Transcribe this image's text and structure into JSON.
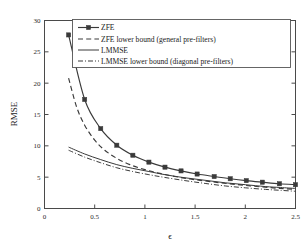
{
  "chart_data": {
    "type": "line",
    "title": "",
    "xlabel": "ϵ",
    "ylabel": "RMSE",
    "xlim": [
      0,
      2.5
    ],
    "ylim": [
      0,
      30
    ],
    "xticks": [
      0,
      0.5,
      1,
      1.5,
      2,
      2.5
    ],
    "xticklabels": [
      "0",
      "0.5",
      "1",
      "1.5",
      "2",
      "2.5"
    ],
    "yticks": [
      0,
      5,
      10,
      15,
      20,
      25,
      30
    ],
    "yticklabels": [
      "0",
      "5",
      "10",
      "15",
      "20",
      "25",
      "30"
    ],
    "grid": false,
    "legend_position": "upper right",
    "series": [
      {
        "name": "ZFE",
        "style": "solid-with-markers",
        "marker": "filled-square",
        "x": [
          0.24,
          0.4,
          0.56,
          0.72,
          0.88,
          1.04,
          1.2,
          1.36,
          1.52,
          1.69,
          1.85,
          2.01,
          2.17,
          2.34,
          2.5
        ],
        "y": [
          27.7,
          17.4,
          12.75,
          10.1,
          8.5,
          7.4,
          6.6,
          6.0,
          5.5,
          5.1,
          4.75,
          4.45,
          4.2,
          3.95,
          3.8
        ]
      },
      {
        "name": "ZFE lower bound (general pre-filters)",
        "style": "dashed",
        "x": [
          0.24,
          0.32,
          0.4,
          0.5,
          0.6,
          0.72,
          0.85,
          1.0,
          1.15,
          1.3,
          1.45,
          1.6,
          1.75,
          1.9,
          2.05,
          2.2,
          2.35,
          2.5
        ],
        "y": [
          20.8,
          16.2,
          13.3,
          10.9,
          9.3,
          8.0,
          7.0,
          6.2,
          5.6,
          5.1,
          4.7,
          4.4,
          4.1,
          3.85,
          3.6,
          3.4,
          3.2,
          3.05
        ]
      },
      {
        "name": "LMMSE",
        "style": "solid",
        "x": [
          0.24,
          0.4,
          0.56,
          0.72,
          0.88,
          1.04,
          1.2,
          1.4,
          1.6,
          1.8,
          2.0,
          2.2,
          2.35,
          2.5
        ],
        "y": [
          9.8,
          8.7,
          7.8,
          7.0,
          6.4,
          5.9,
          5.4,
          4.9,
          4.5,
          4.1,
          3.8,
          3.5,
          3.35,
          3.2
        ]
      },
      {
        "name": "LMMSE lower bound (diagonal pre-filters)",
        "style": "dash-dot",
        "x": [
          0.24,
          0.4,
          0.56,
          0.72,
          0.88,
          1.04,
          1.2,
          1.4,
          1.6,
          1.8,
          2.0,
          2.2,
          2.35,
          2.5
        ],
        "y": [
          9.3,
          8.2,
          7.3,
          6.5,
          5.9,
          5.4,
          4.95,
          4.45,
          4.0,
          3.6,
          3.3,
          3.05,
          2.9,
          2.75
        ]
      }
    ]
  },
  "legend": {
    "items": [
      {
        "label": "ZFE"
      },
      {
        "label": "ZFE lower bound (general pre-filters)"
      },
      {
        "label": "LMMSE"
      },
      {
        "label": "LMMSE lower bound (diagonal pre-filters)"
      }
    ]
  },
  "axes": {
    "x_title": "ϵ",
    "y_title": "RMSE"
  }
}
